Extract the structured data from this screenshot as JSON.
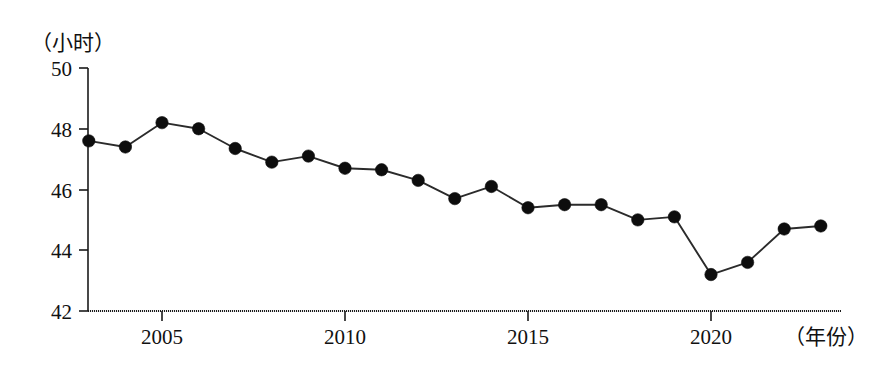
{
  "chart_data": {
    "type": "line",
    "title": "",
    "subtitle": "",
    "xlabel": "（年份）",
    "ylabel": "（小时）",
    "x": [
      2003,
      2004,
      2005,
      2006,
      2007,
      2008,
      2009,
      2010,
      2011,
      2012,
      2013,
      2014,
      2015,
      2016,
      2017,
      2018,
      2019,
      2020,
      2021,
      2022,
      2023
    ],
    "values": [
      47.6,
      47.4,
      48.2,
      48.0,
      47.35,
      46.9,
      47.1,
      46.7,
      46.65,
      46.3,
      45.7,
      46.1,
      45.4,
      45.5,
      45.5,
      45.0,
      45.1,
      43.2,
      43.6,
      44.7,
      44.8
    ],
    "series": [
      {
        "name": "周平均工作时间",
        "values": [
          47.6,
          47.4,
          48.2,
          48.0,
          47.35,
          46.9,
          47.1,
          46.7,
          46.65,
          46.3,
          45.7,
          46.1,
          45.4,
          45.5,
          45.5,
          45.0,
          45.1,
          43.2,
          43.6,
          44.7,
          44.8
        ]
      }
    ],
    "xlim": [
      2002.5,
      2023.8
    ],
    "ylim": [
      42,
      50
    ],
    "y_ticks": [
      42,
      44,
      46,
      48,
      50
    ],
    "y_tick_labels": [
      "42",
      "44",
      "46",
      "48",
      "50"
    ],
    "x_ticks": [
      2005,
      2010,
      2015,
      2020
    ],
    "x_tick_labels": [
      "2005",
      "2010",
      "2015",
      "2020"
    ],
    "grid": false,
    "legend": "none",
    "marker": "filled-circle",
    "line_color": "#2b2b2b",
    "marker_color": "#0d0d0d",
    "background_color": "#ffffff"
  },
  "axes": {
    "y_unit_label": "（小时）",
    "x_unit_label": "（年份）"
  }
}
